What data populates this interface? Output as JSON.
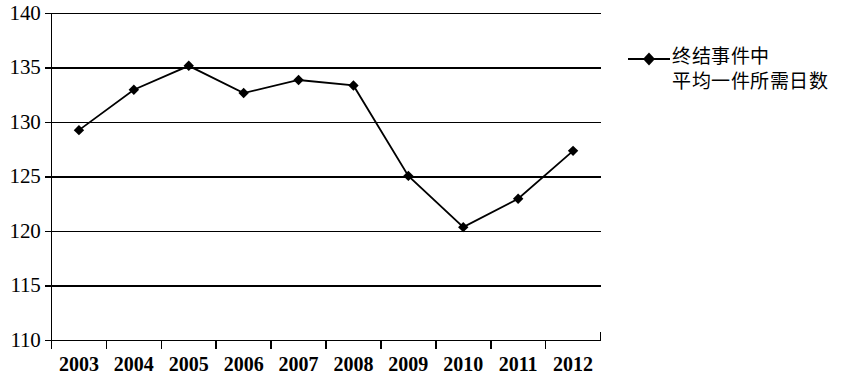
{
  "chart_data": {
    "type": "line",
    "title": "",
    "subtitle": "",
    "xlabel": "",
    "ylabel": "",
    "categories": [
      "2003",
      "2004",
      "2005",
      "2006",
      "2007",
      "2008",
      "2009",
      "2010",
      "2011",
      "2012"
    ],
    "series": [
      {
        "name": "终结事件中平均一件所需日数",
        "values": [
          129.3,
          133.0,
          135.2,
          132.7,
          133.9,
          133.4,
          125.1,
          120.4,
          123.0,
          127.4
        ]
      }
    ],
    "ylim": [
      110,
      140
    ],
    "yticks": [
      110,
      115,
      120,
      125,
      130,
      135,
      140
    ],
    "ytick_labels": [
      "110",
      "115",
      "120",
      "125",
      "130",
      "135",
      "140"
    ],
    "grid": true,
    "grid_axis": "y",
    "legend_position": "right",
    "marker": "diamond",
    "line_color": "#000000",
    "marker_color": "#000000",
    "grid_color": "#000000",
    "background_color": "#ffffff"
  },
  "legend": {
    "marker_icon": "diamond-marker-icon",
    "lines": [
      "终结事件中",
      "平均一件所需日数"
    ]
  }
}
